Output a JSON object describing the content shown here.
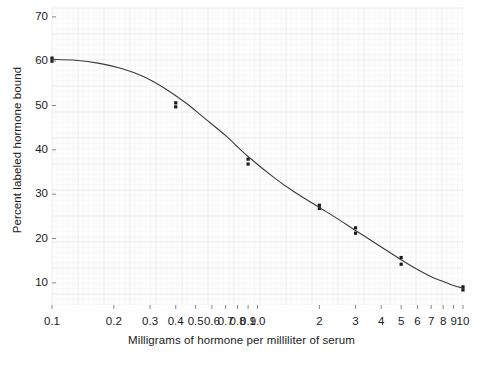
{
  "chart_data": {
    "type": "scatter",
    "title": "",
    "subtitle": "",
    "xlabel": "Milligrams of hormone per milliliter of serum",
    "ylabel": "Percent labeled hormone bound",
    "xscale": "log",
    "yscale": "linear",
    "xlim": [
      0.1,
      10
    ],
    "ylim": [
      5,
      72
    ],
    "grid": true,
    "grid_style": "fine graph-paper grid, very faint",
    "legend": "none",
    "x_tick_labels": [
      "0.1",
      "0.2",
      "0.3",
      "0.4",
      "0.5",
      "0.6",
      "0.7",
      "0.8",
      "0.9",
      "1.0",
      "2",
      "3",
      "4",
      "5",
      "6",
      "7",
      "8",
      "9",
      "10"
    ],
    "x_tick_values": [
      0.1,
      0.2,
      0.3,
      0.4,
      0.5,
      0.6,
      0.7,
      0.8,
      0.9,
      1.0,
      2,
      3,
      4,
      5,
      6,
      7,
      8,
      9,
      10
    ],
    "y_tick_labels": [
      "70",
      "60",
      "50",
      "40",
      "30",
      "20",
      "10"
    ],
    "y_tick_values": [
      70,
      60,
      50,
      40,
      30,
      20,
      10
    ],
    "series": [
      {
        "name": "Percent labeled hormone bound (replicate measurements)",
        "marker": "small filled square",
        "color": "#1a1a1a",
        "points": [
          {
            "x": 0.1,
            "y": 60.7
          },
          {
            "x": 0.1,
            "y": 60.0
          },
          {
            "x": 0.4,
            "y": 50.6
          },
          {
            "x": 0.4,
            "y": 49.7
          },
          {
            "x": 0.9,
            "y": 37.9
          },
          {
            "x": 0.9,
            "y": 36.8
          },
          {
            "x": 2.0,
            "y": 27.5
          },
          {
            "x": 2.0,
            "y": 26.8
          },
          {
            "x": 3.0,
            "y": 22.4
          },
          {
            "x": 3.0,
            "y": 21.2
          },
          {
            "x": 5.0,
            "y": 15.7
          },
          {
            "x": 5.0,
            "y": 14.2
          },
          {
            "x": 10.0,
            "y": 9.1
          },
          {
            "x": 10.0,
            "y": 8.4
          }
        ]
      },
      {
        "name": "Fitted dose-response curve",
        "marker": "none",
        "line": "solid",
        "color": "#3b3b3b",
        "points": [
          {
            "x": 0.1,
            "y": 60.4
          },
          {
            "x": 0.13,
            "y": 60.2
          },
          {
            "x": 0.17,
            "y": 59.5
          },
          {
            "x": 0.22,
            "y": 58.3
          },
          {
            "x": 0.28,
            "y": 56.5
          },
          {
            "x": 0.35,
            "y": 54.0
          },
          {
            "x": 0.45,
            "y": 50.5
          },
          {
            "x": 0.55,
            "y": 47.2
          },
          {
            "x": 0.7,
            "y": 43.2
          },
          {
            "x": 0.9,
            "y": 38.5
          },
          {
            "x": 1.2,
            "y": 33.8
          },
          {
            "x": 1.5,
            "y": 30.6
          },
          {
            "x": 2.0,
            "y": 27.0
          },
          {
            "x": 2.5,
            "y": 24.2
          },
          {
            "x": 3.0,
            "y": 21.8
          },
          {
            "x": 4.0,
            "y": 18.1
          },
          {
            "x": 5.0,
            "y": 15.2
          },
          {
            "x": 6.0,
            "y": 13.0
          },
          {
            "x": 7.0,
            "y": 11.4
          },
          {
            "x": 8.0,
            "y": 10.3
          },
          {
            "x": 9.0,
            "y": 9.4
          },
          {
            "x": 10.0,
            "y": 8.8
          }
        ]
      }
    ]
  },
  "axis": {
    "y_title": "Percent labeled hormone bound",
    "x_title": "Milligrams of hormone per milliliter of serum"
  },
  "colors": {
    "curve": "#3b3b3b",
    "marker": "#1a1a1a",
    "grid": "#ececed",
    "grid_major": "#e2e2e4",
    "text": "#1a1a1a",
    "background": "#ffffff"
  }
}
